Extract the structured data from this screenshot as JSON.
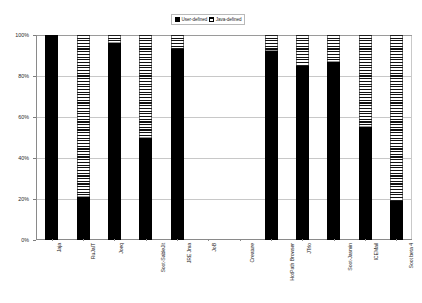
{
  "chart_data": {
    "type": "bar",
    "subtype": "stacked-percent",
    "title": "",
    "xlabel": "",
    "ylabel": "",
    "ylim": [
      0,
      100
    ],
    "y_ticks": [
      "0%",
      "20%",
      "40%",
      "60%",
      "80%",
      "100%"
    ],
    "y_tick_values": [
      0,
      20,
      40,
      60,
      80,
      100
    ],
    "grid": true,
    "legend_position": "top-center",
    "categories": [
      "Jaja",
      "RuJaIT",
      "Joeq",
      "Soot-SableJit",
      "JRE Jma",
      "JoB",
      "Creature",
      "HotPath Browser",
      "JTrlo",
      "Soot-Jasmin",
      "ICEMail",
      "Soot beta 4"
    ],
    "series": [
      {
        "name": "User-defined",
        "swatch": "solid-black",
        "color": "#000000",
        "values": [
          100,
          21,
          96,
          50,
          93,
          0,
          0,
          92,
          85,
          87,
          55,
          19
        ]
      },
      {
        "name": "Java-defined",
        "swatch": "horizontal-stripes",
        "color": "#ffffff",
        "values": [
          0,
          79,
          4,
          50,
          7,
          0,
          0,
          8,
          15,
          13,
          45,
          81
        ]
      }
    ],
    "empty_categories": [
      "JoB",
      "Creature"
    ]
  },
  "legend": {
    "entries": [
      {
        "label": "User-defined"
      },
      {
        "label": "Java-defined"
      }
    ]
  },
  "colors": {
    "user_defined": "#000000",
    "java_defined": "#ffffff",
    "axis": "#8a8a8a",
    "grid": "#c8c8c8",
    "background": "#ffffff"
  }
}
